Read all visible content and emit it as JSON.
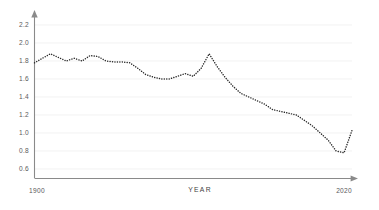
{
  "chart_data": {
    "type": "line",
    "title": "",
    "subtitle": "",
    "xlabel": "YEAR",
    "ylabel": "",
    "grid": true,
    "legend": false,
    "line_style": "dotted",
    "line_color": "#2b2b2b",
    "xlim": [
      1900,
      2020
    ],
    "ylim": [
      0.5,
      2.3
    ],
    "x_tick_labels": [
      "1900",
      "2020"
    ],
    "x_ticks": [
      1900,
      2020
    ],
    "y_ticks": [
      2.2,
      2.0,
      1.8,
      1.6,
      1.4,
      1.2,
      1.0,
      0.8,
      0.6
    ],
    "y_tick_labels": [
      "2.2",
      "2.0",
      "1.8",
      "1.6",
      "1.4",
      "1.2",
      "1.0",
      "0.8",
      "0.6"
    ],
    "series": [
      {
        "name": "value",
        "x": [
          1900,
          1903,
          1906,
          1909,
          1912,
          1915,
          1918,
          1921,
          1924,
          1927,
          1930,
          1933,
          1936,
          1939,
          1942,
          1945,
          1948,
          1951,
          1954,
          1957,
          1960,
          1963,
          1966,
          1969,
          1972,
          1975,
          1978,
          1981,
          1984,
          1987,
          1990,
          1993,
          1996,
          1999,
          2002,
          2005,
          2008,
          2011,
          2014,
          2017,
          2020
        ],
        "values": [
          1.78,
          1.83,
          1.88,
          1.84,
          1.8,
          1.83,
          1.8,
          1.86,
          1.85,
          1.8,
          1.79,
          1.79,
          1.78,
          1.72,
          1.65,
          1.62,
          1.6,
          1.6,
          1.63,
          1.66,
          1.63,
          1.72,
          1.88,
          1.74,
          1.62,
          1.52,
          1.44,
          1.4,
          1.36,
          1.32,
          1.26,
          1.24,
          1.22,
          1.2,
          1.14,
          1.08,
          1.0,
          0.92,
          0.8,
          0.78,
          1.03
        ]
      }
    ]
  },
  "axis": {
    "x_title": "YEAR",
    "x_start_label": "1900",
    "x_end_label": "2020"
  }
}
